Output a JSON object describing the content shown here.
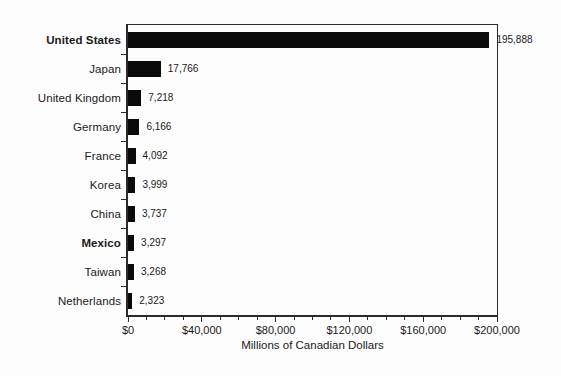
{
  "chart_data": {
    "type": "bar",
    "orientation": "horizontal",
    "title": "",
    "xlabel": "Millions of Canadian Dollars",
    "ylabel": "",
    "categories": [
      "United States",
      "Japan",
      "United Kingdom",
      "Germany",
      "France",
      "Korea",
      "China",
      "Mexico",
      "Taiwan",
      "Netherlands"
    ],
    "values": [
      195888,
      17766,
      7218,
      6166,
      4092,
      3999,
      3737,
      3297,
      3268,
      2323
    ],
    "value_labels": [
      "195,888",
      "17,766",
      "7,218",
      "6,166",
      "4,092",
      "3,999",
      "3,737",
      "3,297",
      "3,268",
      "2,323"
    ],
    "bold_categories": [
      true,
      false,
      false,
      false,
      false,
      false,
      false,
      true,
      false,
      false
    ],
    "xlim": [
      0,
      200000
    ],
    "x_tick_values": [
      0,
      40000,
      80000,
      120000,
      160000,
      200000
    ],
    "x_tick_labels": [
      "$0",
      "$40,000",
      "$80,000",
      "$120,000",
      "$160,000",
      "$200,000"
    ],
    "minor_tick_step": 10000,
    "grid": "off",
    "legend": "none",
    "colors": {
      "bar": "#0a0a0a",
      "axis": "#2b2b2b",
      "text": "#1a1a1a",
      "background": "#fdfdfd"
    }
  }
}
